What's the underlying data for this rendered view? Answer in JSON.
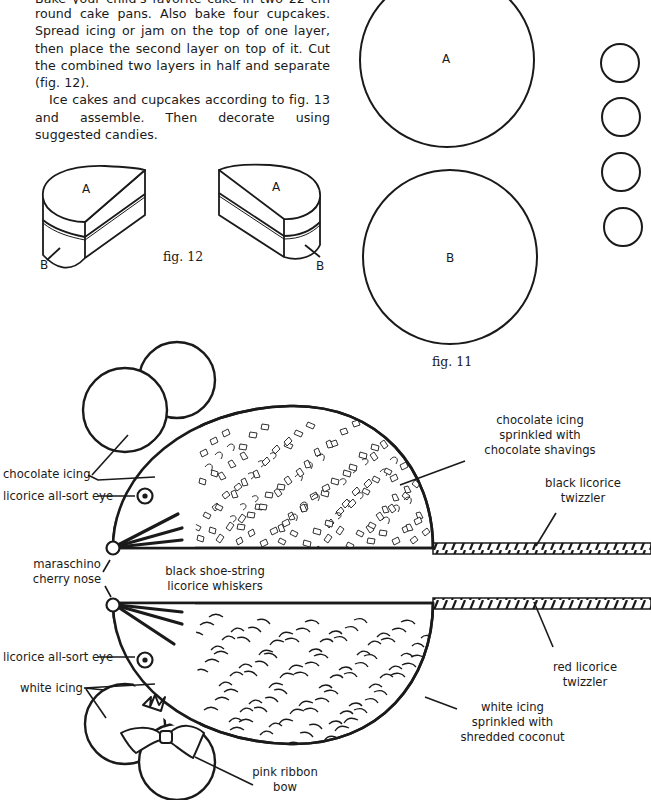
{
  "instructions": {
    "partial_line": "Bake your child's favorite cake in two 22 cm (9\")",
    "paragraph1": "round cake pans. Also bake four cupcakes. Spread icing or jam on the top of one layer, then place the second layer on top of it. Cut the combined two layers in half and separate (fig. 12).",
    "paragraph2": "Ice cakes and cupcakes according to fig. 13 and assemble. Then decorate using suggested candies."
  },
  "fig11": {
    "caption": "fig. 11",
    "circle_a_label": "A",
    "circle_b_label": "B",
    "cupcake_count": 4
  },
  "fig12": {
    "caption": "fig. 12",
    "left_piece": {
      "top_label": "A",
      "side_label": "B"
    },
    "right_piece": {
      "top_label": "A",
      "side_label": "B"
    }
  },
  "fig13": {
    "top_mouse": {
      "labels": {
        "ears": "chocolate icing",
        "eye": "licorice all-sort eye",
        "body": [
          "chocolate icing",
          "sprinkled with",
          "chocolate shavings"
        ],
        "tail": [
          "black licorice",
          "twizzler"
        ]
      }
    },
    "shared": {
      "nose": [
        "maraschino",
        "cherry nose"
      ],
      "whiskers": [
        "black shoe-string",
        "licorice whiskers"
      ]
    },
    "bottom_mouse": {
      "labels": {
        "eye": "licorice all-sort eye",
        "ears": "white icing",
        "body": [
          "white icing",
          "sprinkled with",
          "shredded coconut"
        ],
        "tail": [
          "red licorice",
          "twizzler"
        ],
        "bow": [
          "pink ribbon",
          "bow"
        ]
      }
    }
  },
  "colors": {
    "ink": "#1a1a1a",
    "paper": "#ffffff"
  }
}
